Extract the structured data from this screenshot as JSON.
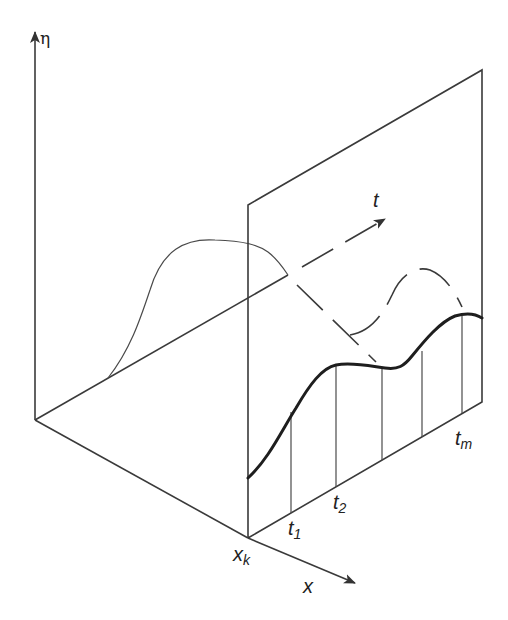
{
  "figure": {
    "type": "3d-schematic",
    "colors": {
      "line": "#3a3a3a",
      "curve": "#1e1e1e",
      "background": "#ffffff"
    }
  },
  "axes": {
    "eta": {
      "label": "η"
    },
    "t": {
      "label": "t"
    },
    "x": {
      "label": "x"
    }
  },
  "markers": {
    "x_position": {
      "base": "x",
      "sub": "k"
    },
    "times": [
      {
        "base": "t",
        "sub": "1"
      },
      {
        "base": "t",
        "sub": "2"
      },
      {
        "base": "t",
        "sub": "m"
      }
    ]
  }
}
